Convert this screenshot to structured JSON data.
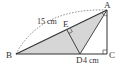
{
  "diagram": {
    "type": "geometry",
    "points": {
      "A": {
        "label": "A",
        "x": 107,
        "y": 10
      },
      "B": {
        "label": "B",
        "x": 16,
        "y": 54
      },
      "C": {
        "label": "C",
        "x": 107,
        "y": 54
      },
      "D": {
        "label": "D",
        "x": 80,
        "y": 54
      },
      "E": {
        "label": "E",
        "x": 67,
        "y": 30
      }
    },
    "measurements": {
      "arc_BA": "15 cm",
      "segment_DC": "4 cm"
    },
    "colors": {
      "shade": "#d6d6d6",
      "line": "#333333",
      "dashed": "#555555"
    }
  }
}
